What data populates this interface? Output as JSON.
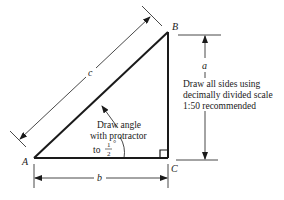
{
  "diagram": {
    "type": "right-triangle construction drawing",
    "vertices": {
      "A": {
        "label": "A"
      },
      "B": {
        "label": "B"
      },
      "C": {
        "label": "C"
      }
    },
    "sides": {
      "a": {
        "label": "a"
      },
      "b": {
        "label": "b"
      },
      "c": {
        "label": "c"
      }
    },
    "angle_note": {
      "line1": "Draw angle",
      "line2": "with protractor",
      "line3_prefix": "to",
      "fraction_num": "1",
      "fraction_den": "2",
      "degree": "°"
    },
    "scale_note": {
      "line1": "Draw all sides using",
      "line2": "decimally divided scale",
      "line3": "1:50 recommended"
    },
    "colors": {
      "stroke": "#1a1a1a",
      "background": "#ffffff"
    }
  }
}
